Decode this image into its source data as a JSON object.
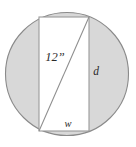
{
  "figure": {
    "name": "rectangle-inscribed-in-circle",
    "canvas": {
      "width": 136,
      "height": 147,
      "background": "#ffffff"
    },
    "colors": {
      "circle_fill": "#d8d8d8",
      "circle_stroke": "#8a8a8a",
      "rect_fill": "#ffffff",
      "rect_stroke": "#9a9a9a",
      "diagonal_stroke": "#8e8e8e",
      "label_color": "#2b2b2b"
    },
    "circle": {
      "cx": 67,
      "cy": 74,
      "r": 61.5
    },
    "rectangle": {
      "x": 39,
      "y": 17,
      "width": 50,
      "height": 114
    },
    "diagonal": {
      "x1": 39,
      "y1": 131,
      "x2": 89,
      "y2": 17
    },
    "labels": {
      "diagonal": {
        "text": "12”",
        "x": 55,
        "y": 58
      },
      "height": {
        "text": "d",
        "x": 96,
        "y": 72
      },
      "width": {
        "text": "w",
        "x": 68,
        "y": 125
      }
    }
  }
}
